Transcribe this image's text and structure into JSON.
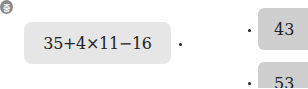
{
  "badge": {
    "label": "중"
  },
  "expression": {
    "text": "35+4×11−16"
  },
  "answers": [
    {
      "text": "43"
    },
    {
      "text": "53"
    }
  ]
}
